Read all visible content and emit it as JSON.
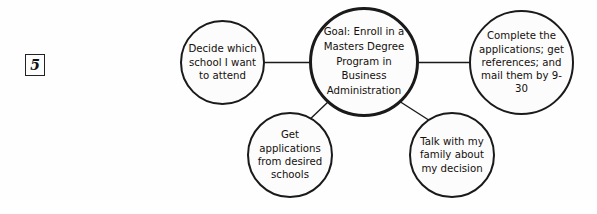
{
  "item": {
    "number": "5"
  },
  "diagram": {
    "type": "cluster-map",
    "center": {
      "id": "goal",
      "text": "Goal: Enroll in a Masters Degree Program in Business Administration"
    },
    "nodes": [
      {
        "id": "decide",
        "text": "Decide which school I want to attend"
      },
      {
        "id": "complete",
        "text": "Complete the applications; get references; and mail them by 9-30"
      },
      {
        "id": "getapps",
        "text": "Get applications from desired schools"
      },
      {
        "id": "talk",
        "text": "Talk with my family about my decision"
      }
    ],
    "connectors": [
      {
        "from": "decide",
        "to": "goal"
      },
      {
        "from": "goal",
        "to": "complete"
      },
      {
        "from": "goal",
        "to": "getapps"
      },
      {
        "from": "goal",
        "to": "talk"
      }
    ],
    "colors": {
      "stroke": "#1a1a1a",
      "fill": "#fcfcfc",
      "text": "#15100c",
      "background": "#fefefe"
    }
  }
}
